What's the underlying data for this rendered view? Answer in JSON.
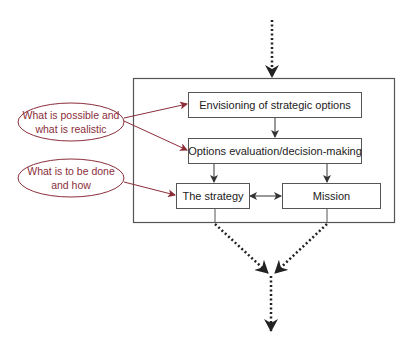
{
  "diagram": {
    "boxes": {
      "envisioning": "Envisioning of strategic options",
      "options": "Options evaluation/decision-making",
      "strategy": "The strategy",
      "mission": "Mission"
    },
    "annotations": {
      "possible": "What is possible and\nwhat is realistic",
      "todo": "What is to be done\nand how"
    },
    "colors": {
      "box_stroke": "#555555",
      "annotation": "#8b2e3a",
      "arrow": "#222222"
    }
  }
}
